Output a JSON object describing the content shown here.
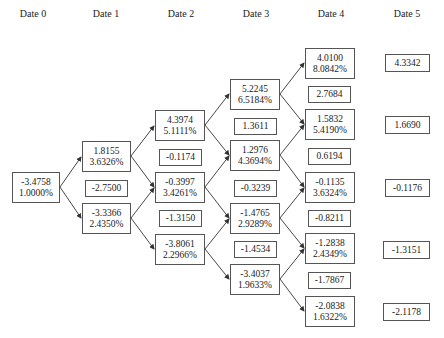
{
  "headers": [
    "Date 0",
    "Date 1",
    "Date 2",
    "Date 3",
    "Date 4",
    "Date 5"
  ],
  "nodes": {
    "d0": {
      "value": "-3.4758",
      "rate": "1.0000%"
    },
    "d1u": {
      "value": "1.8155",
      "rate": "3.6326%"
    },
    "d1m": {
      "value": "-2.7500"
    },
    "d1d": {
      "value": "-3.3366",
      "rate": "2.4350%"
    },
    "d2a": {
      "value": "4.3974",
      "rate": "5.1111%"
    },
    "d2ab": {
      "value": "-0.1174"
    },
    "d2b": {
      "value": "-0.3997",
      "rate": "3.4261%"
    },
    "d2bc": {
      "value": "-1.3150"
    },
    "d2c": {
      "value": "-3.8061",
      "rate": "2.2966%"
    },
    "d3a": {
      "value": "5.2245",
      "rate": "6.5184%"
    },
    "d3ab": {
      "value": "1.3611"
    },
    "d3b": {
      "value": "1.2976",
      "rate": "4.3694%"
    },
    "d3bc": {
      "value": "-0.3239"
    },
    "d3c": {
      "value": "-1.4765",
      "rate": "2.9289%"
    },
    "d3cd": {
      "value": "-1.4534"
    },
    "d3d": {
      "value": "-3.4037",
      "rate": "1.9633%"
    },
    "d4a": {
      "value": "4.0100",
      "rate": "8.0842%"
    },
    "d4ab": {
      "value": "2.7684"
    },
    "d4b": {
      "value": "1.5832",
      "rate": "5.4190%"
    },
    "d4bc": {
      "value": "0.6194"
    },
    "d4c": {
      "value": "-0.1135",
      "rate": "3.6324%"
    },
    "d4cd": {
      "value": "-0.8211"
    },
    "d4d": {
      "value": "-1.2838",
      "rate": "2.4349%"
    },
    "d4de": {
      "value": "-1.7867"
    },
    "d4e": {
      "value": "-2.0838",
      "rate": "1.6322%"
    },
    "d5a": {
      "value": "4.3342"
    },
    "d5b": {
      "value": "1.6690"
    },
    "d5c": {
      "value": "-0.1176"
    },
    "d5d": {
      "value": "-1.3151"
    },
    "d5e": {
      "value": "-2.1178"
    }
  },
  "colors": {
    "border": "#555555",
    "arrow": "#333333",
    "text": "#222222"
  }
}
